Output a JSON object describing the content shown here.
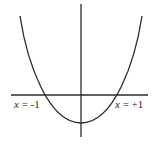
{
  "diagram": {
    "type": "function-graph",
    "colors": {
      "background": "#ffffff",
      "stroke": "#2a2a2a",
      "text": "#2a2a2a"
    },
    "labels": {
      "left_root": {
        "var": "x",
        "eq": " = -1"
      },
      "right_root": {
        "var": "x",
        "eq": " = +1"
      }
    },
    "roots": [
      -1,
      1
    ]
  }
}
